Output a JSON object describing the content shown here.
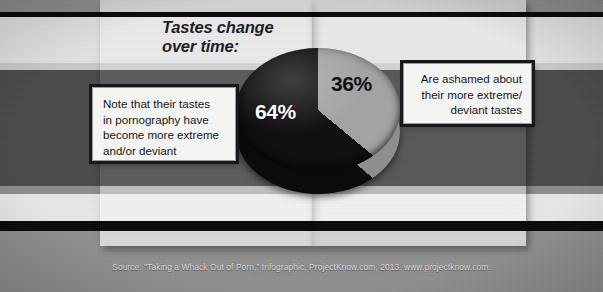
{
  "headline": {
    "line1": "Tastes change",
    "line2": "over time:"
  },
  "callout_left": {
    "line1": "Note that their tastes",
    "line2": "in pornography have",
    "line3": "become more extreme",
    "line4": "and/or deviant"
  },
  "callout_right": {
    "line1": "Are ashamed about",
    "line2": "their more extreme/",
    "line3": "deviant tastes"
  },
  "source": "Source: “Taking a Whack Out of Porn,” Infographic, ProjectKnow.com, 2013. www.projectknow.com.",
  "colors": {
    "slice_dark": "#101012",
    "slice_gray": "#a3a3a3",
    "headline_text": "#1b1f28",
    "callout_bg": "#f4f4f2",
    "callout_border": "#16181c",
    "band_dark": "#4a4a4a",
    "band_light": "#e2e2e2",
    "stripe_black": "#0a0a0a"
  },
  "chart_data": {
    "type": "pie",
    "title": "Tastes change over time:",
    "categories": [
      "Note that their tastes in pornography have become more extreme and/or deviant",
      "Are ashamed about their more extreme/deviant tastes"
    ],
    "values": [
      64,
      36
    ],
    "labels": [
      "64%",
      "36%"
    ],
    "unit": "percent",
    "colors": [
      "#101012",
      "#a3a3a3"
    ],
    "legend": "callout boxes",
    "legend_position": "left and right of pie",
    "grid": false,
    "three_d": true,
    "xlabel": "",
    "ylabel": ""
  }
}
